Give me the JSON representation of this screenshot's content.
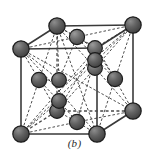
{
  "figure": {
    "caption": "(b)",
    "kind": "crystal-lattice-diagram"
  },
  "style": {
    "background": "#ffffff",
    "atom_fill": "#5a5a5a",
    "atom_fill_light": "#7e7e7e",
    "atom_stroke": "#1c1c1c",
    "edge_solid_color": "#3a3a3a",
    "edge_dashed_color": "#4a4a4a",
    "bond_color": "#2e2e2e",
    "caption_color": "#2a2a2a",
    "atom_radius_corner": 8.2,
    "atom_radius_face": 7.6,
    "atom_radius_interior": 7.4,
    "edge_width": 1.6,
    "dash_pattern": "3,2.4",
    "bond_width": 0.9
  },
  "geometry": {
    "cube_corners": {
      "front_top_left": {
        "name": "corner-front-top-left",
        "x": 21,
        "y": 49,
        "hidden": false
      },
      "front_top_right": {
        "name": "corner-front-top-right",
        "x": 97,
        "y": 48,
        "hidden": false
      },
      "front_bottom_left": {
        "name": "corner-front-bottom-left",
        "x": 21,
        "y": 134,
        "hidden": false
      },
      "front_bottom_right": {
        "name": "corner-front-bottom-right",
        "x": 97,
        "y": 134,
        "hidden": false
      },
      "back_top_left": {
        "name": "corner-back-top-left",
        "x": 57,
        "y": 26,
        "hidden": false
      },
      "back_top_right": {
        "name": "corner-back-top-right",
        "x": 133,
        "y": 25,
        "hidden": false
      },
      "back_bottom_left": {
        "name": "corner-back-bottom-left",
        "x": 57,
        "y": 111,
        "hidden": true
      },
      "back_bottom_right": {
        "name": "corner-back-bottom-right",
        "x": 133,
        "y": 111,
        "hidden": false
      }
    },
    "face_centers": {
      "top": {
        "name": "face-center-top",
        "x": 77,
        "y": 37
      },
      "bottom": {
        "name": "face-center-bottom",
        "x": 77,
        "y": 122
      },
      "front": {
        "name": "face-center-front",
        "x": 59,
        "y": 91
      },
      "back": {
        "name": "face-center-back",
        "x": 95,
        "y": 68
      },
      "left": {
        "name": "face-center-left",
        "x": 39,
        "y": 80
      },
      "right": {
        "name": "face-center-right",
        "x": 115,
        "y": 79
      }
    },
    "interior_atoms": [
      {
        "name": "interior-atom-1",
        "x": 95,
        "y": 48
      },
      {
        "name": "interior-atom-2",
        "x": 95,
        "y": 58
      },
      {
        "name": "interior-atom-3",
        "x": 59,
        "y": 80
      },
      {
        "name": "interior-atom-4",
        "x": 59,
        "y": 101
      },
      {
        "name": "interior-atom-5",
        "x": 77,
        "y": 122
      },
      {
        "name": "interior-atom-6",
        "x": 77,
        "y": 37
      }
    ]
  },
  "atom_count": {
    "corners": 8,
    "face_centers": 6,
    "interior": 4
  }
}
